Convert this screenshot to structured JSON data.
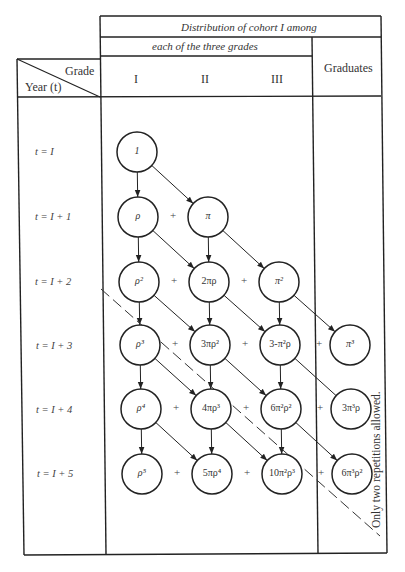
{
  "header": {
    "title_row": "Distribution of cohort I among",
    "grades_row": "each of the three grades",
    "corner_grade": "Grade",
    "corner_year": "Year (t)",
    "columns": [
      "I",
      "II",
      "III"
    ],
    "graduates": "Graduates"
  },
  "rows": [
    {
      "label": "t = I"
    },
    {
      "label": "t = I + 1"
    },
    {
      "label": "t = I + 2"
    },
    {
      "label": "t = I + 3"
    },
    {
      "label": "t = I + 4"
    },
    {
      "label": "t = I + 5"
    }
  ],
  "nodes": [
    {
      "id": "n00",
      "row": 0,
      "col": 0,
      "label": "1"
    },
    {
      "id": "n10",
      "row": 1,
      "col": 0,
      "label": "ρ"
    },
    {
      "id": "n11",
      "row": 1,
      "col": 1,
      "label": "π"
    },
    {
      "id": "n20",
      "row": 2,
      "col": 0,
      "label": "ρ²"
    },
    {
      "id": "n21",
      "row": 2,
      "col": 1,
      "label": "2πρ"
    },
    {
      "id": "n22",
      "row": 2,
      "col": 2,
      "label": "π²"
    },
    {
      "id": "n30",
      "row": 3,
      "col": 0,
      "label": "ρ³"
    },
    {
      "id": "n31",
      "row": 3,
      "col": 1,
      "label": "3πρ²"
    },
    {
      "id": "n32",
      "row": 3,
      "col": 2,
      "label": "3-π²ρ"
    },
    {
      "id": "n33",
      "row": 3,
      "col": 3,
      "label": "π³"
    },
    {
      "id": "n40",
      "row": 4,
      "col": 0,
      "label": "ρ⁴"
    },
    {
      "id": "n41",
      "row": 4,
      "col": 1,
      "label": "4πρ³"
    },
    {
      "id": "n42",
      "row": 4,
      "col": 2,
      "label": "6π²ρ²"
    },
    {
      "id": "n43",
      "row": 4,
      "col": 3,
      "label": "3π³ρ"
    },
    {
      "id": "n50",
      "row": 5,
      "col": 0,
      "label": "ρ⁵"
    },
    {
      "id": "n51",
      "row": 5,
      "col": 1,
      "label": "5πρ⁴"
    },
    {
      "id": "n52",
      "row": 5,
      "col": 2,
      "label": "10π²ρ³"
    },
    {
      "id": "n53",
      "row": 5,
      "col": 3,
      "label": "6π³ρ²"
    }
  ],
  "edges": [
    {
      "from": "n00",
      "to": "n10",
      "head": true
    },
    {
      "from": "n00",
      "to": "n11",
      "head": true
    },
    {
      "from": "n10",
      "to": "n20",
      "head": true
    },
    {
      "from": "n10",
      "to": "n21",
      "head": true
    },
    {
      "from": "n11",
      "to": "n21",
      "head": true
    },
    {
      "from": "n11",
      "to": "n22",
      "head": true
    },
    {
      "from": "n20",
      "to": "n30",
      "head": true
    },
    {
      "from": "n20",
      "to": "n31",
      "head": true
    },
    {
      "from": "n21",
      "to": "n31",
      "head": true
    },
    {
      "from": "n21",
      "to": "n32",
      "head": true
    },
    {
      "from": "n22",
      "to": "n32",
      "head": true
    },
    {
      "from": "n22",
      "to": "n33",
      "head": true
    },
    {
      "from": "n30",
      "to": "n40",
      "head": true
    },
    {
      "from": "n30",
      "to": "n41",
      "head": true
    },
    {
      "from": "n31",
      "to": "n41",
      "head": true
    },
    {
      "from": "n31",
      "to": "n42",
      "head": true
    },
    {
      "from": "n32",
      "to": "n42",
      "head": true
    },
    {
      "from": "n32",
      "to": "n43",
      "head": false
    },
    {
      "from": "n40",
      "to": "n50",
      "head": true
    },
    {
      "from": "n40",
      "to": "n51",
      "head": true
    },
    {
      "from": "n41",
      "to": "n51",
      "head": true
    },
    {
      "from": "n41",
      "to": "n52",
      "head": true
    },
    {
      "from": "n42",
      "to": "n52",
      "head": true
    },
    {
      "from": "n42",
      "to": "n53",
      "head": true
    }
  ],
  "plus_signs": [
    {
      "row": 1,
      "between": [
        0,
        1
      ]
    },
    {
      "row": 2,
      "between": [
        0,
        1
      ]
    },
    {
      "row": 2,
      "between": [
        1,
        2
      ]
    },
    {
      "row": 3,
      "between": [
        0,
        1
      ]
    },
    {
      "row": 3,
      "between": [
        1,
        2
      ]
    },
    {
      "row": 3,
      "between": [
        2,
        3
      ]
    },
    {
      "row": 4,
      "between": [
        0,
        1
      ]
    },
    {
      "row": 4,
      "between": [
        1,
        2
      ]
    },
    {
      "row": 4,
      "between": [
        2,
        3
      ]
    },
    {
      "row": 5,
      "between": [
        0,
        1
      ]
    },
    {
      "row": 5,
      "between": [
        1,
        2
      ]
    },
    {
      "row": 5,
      "between": [
        2,
        3
      ]
    }
  ],
  "note": "Only two repetitions allowed.",
  "layout": {
    "col_x": [
      137,
      207,
      277,
      347
    ],
    "row_y": [
      152,
      217,
      282,
      345,
      409,
      474
    ],
    "radius": 20,
    "dashed_line": {
      "x1": 101,
      "y1": 289,
      "x2": 380,
      "y2": 536
    },
    "line_color": "#222222"
  }
}
